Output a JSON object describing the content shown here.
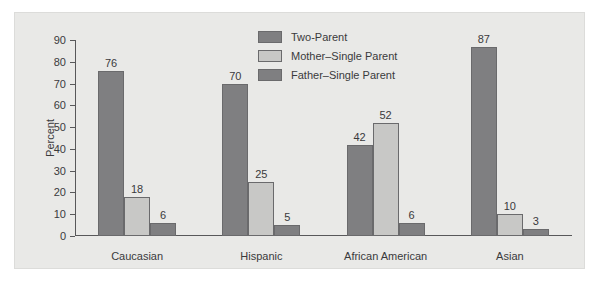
{
  "chart_data": {
    "type": "bar",
    "title": "",
    "xlabel": "",
    "ylabel": "Percent",
    "ylim": [
      0,
      90
    ],
    "yticks": [
      0,
      10,
      20,
      30,
      40,
      50,
      60,
      70,
      80,
      90
    ],
    "grid": false,
    "legend_position": "top-center",
    "categories": [
      "Caucasian",
      "Hispanic",
      "African American",
      "Asian"
    ],
    "series": [
      {
        "name": "Two-Parent",
        "color": "#7f7f81",
        "values": [
          76,
          70,
          42,
          87
        ]
      },
      {
        "name": "Mother–Single Parent",
        "color": "#c8c8c6",
        "values": [
          18,
          25,
          52,
          10
        ]
      },
      {
        "name": "Father–Single Parent",
        "color": "#7f7f81",
        "values": [
          6,
          5,
          6,
          3
        ]
      }
    ]
  },
  "figure": {
    "background": "#e9e9e7",
    "axis_color": "#58585a"
  }
}
